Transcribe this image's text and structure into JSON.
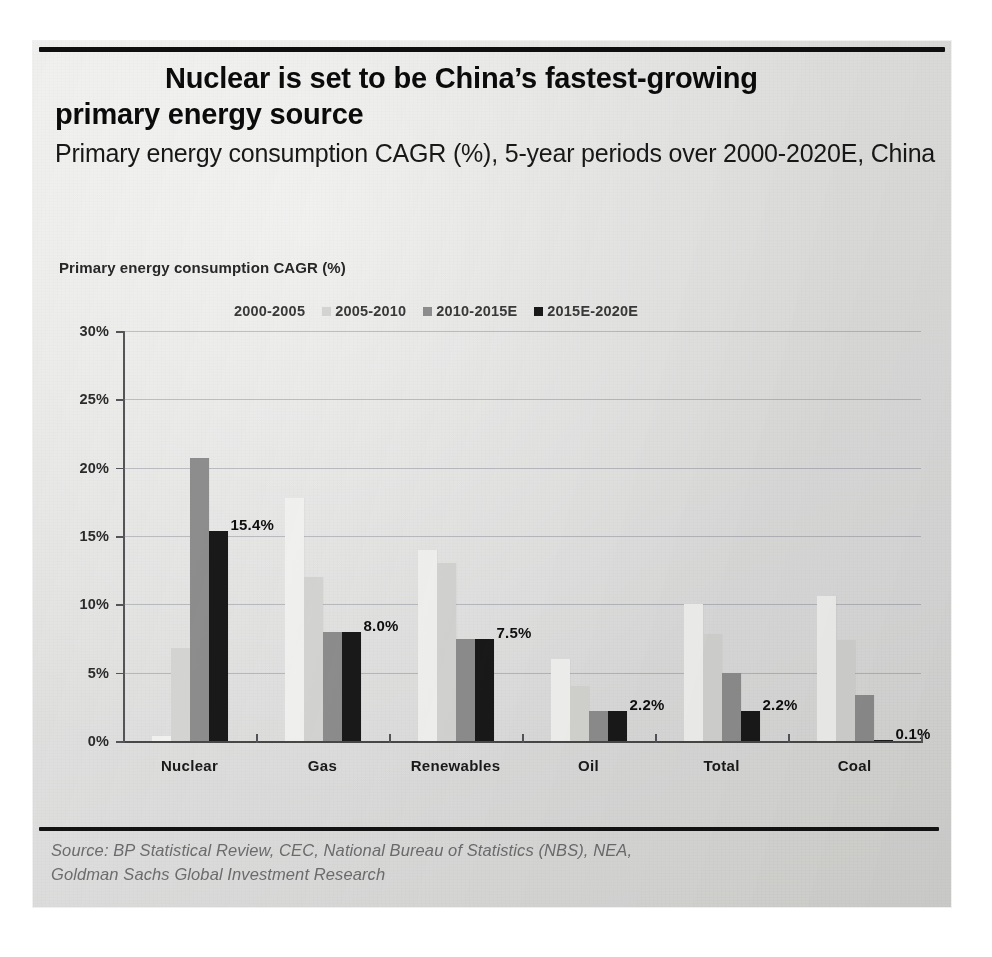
{
  "page": {
    "title": "Nuclear is set to be China’s fastest-growing primary energy source",
    "title_line1": "Nuclear is set to be China’s fastest-growing",
    "title_line2": "primary energy source",
    "subtitle": "Primary energy consumption CAGR (%), 5-year periods over 2000-2020E, China",
    "background_color": "#e3e3e1"
  },
  "source": {
    "line1": "Source: BP Statistical Review, CEC, National Bureau of Statistics (NBS), NEA,",
    "line2": "Goldman Sachs Global Investment Research"
  },
  "chart_data": {
    "type": "bar",
    "title": "Primary energy consumption CAGR (%)",
    "xlabel": "",
    "ylabel": "",
    "ylim": [
      0,
      30
    ],
    "ytick_labels": [
      "0%",
      "5%",
      "10%",
      "15%",
      "20%",
      "25%",
      "30%"
    ],
    "ytick_values": [
      0,
      5,
      10,
      15,
      20,
      25,
      30
    ],
    "grid": true,
    "legend_position": "top",
    "categories": [
      "Nuclear",
      "Gas",
      "Renewables",
      "Oil",
      "Total",
      "Coal"
    ],
    "series": [
      {
        "name": "2000-2005",
        "color": "#f3f3f1",
        "values": [
          0.4,
          17.8,
          14.0,
          6.0,
          10.0,
          10.6
        ]
      },
      {
        "name": "2005-2010",
        "color": "#d5d5d3",
        "values": [
          6.8,
          12.0,
          13.0,
          4.0,
          7.8,
          7.4
        ]
      },
      {
        "name": "2010-2015E",
        "color": "#8f8f8f",
        "values": [
          20.7,
          8.0,
          7.5,
          2.2,
          5.0,
          3.4
        ]
      },
      {
        "name": "2015E-2020E",
        "color": "#1b1b1b",
        "values": [
          15.4,
          8.0,
          7.5,
          2.2,
          2.2,
          0.1
        ]
      }
    ],
    "data_labels": [
      {
        "category": "Nuclear",
        "text": "15.4%"
      },
      {
        "category": "Gas",
        "text": "8.0%"
      },
      {
        "category": "Renewables",
        "text": "7.5%"
      },
      {
        "category": "Oil",
        "text": "2.2%"
      },
      {
        "category": "Total",
        "text": "2.2%"
      },
      {
        "category": "Coal",
        "text": "0.1%"
      }
    ]
  }
}
